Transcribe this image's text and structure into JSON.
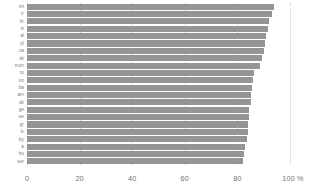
{
  "chart_data": {
    "type": "bar",
    "orientation": "horizontal",
    "title": "",
    "subtitle": "",
    "xlabel": "",
    "ylabel": "",
    "xlim": [
      0,
      100
    ],
    "xticks": [
      0,
      20,
      40,
      60,
      80,
      100
    ],
    "xticklabels": [
      "0",
      "20",
      "40",
      "60",
      "80",
      "100 %"
    ],
    "unit": "%",
    "grid": true,
    "grid_axis": "x",
    "grid_style": "dotted",
    "legend": false,
    "bar_color": "#959595",
    "categories": [
      "mt",
      "tr",
      "hr",
      "is",
      "al",
      "pl",
      "ca",
      "sk",
      "mon",
      "ro",
      "no",
      "ba",
      "am",
      "dk",
      "ge",
      "ee",
      "gr",
      "lv",
      "by",
      "a",
      "hu",
      "ser"
    ],
    "values": [
      94.0,
      93.0,
      92.0,
      91.5,
      91.0,
      90.5,
      90.0,
      89.5,
      88.5,
      86.5,
      86.0,
      85.5,
      85.0,
      85.0,
      84.5,
      84.5,
      84.0,
      84.0,
      83.5,
      83.0,
      82.5,
      82.0
    ],
    "series": [
      {
        "name": "",
        "values": [
          94.0,
          93.0,
          92.0,
          91.5,
          91.0,
          90.5,
          90.0,
          89.5,
          88.5,
          86.5,
          86.0,
          85.5,
          85.0,
          85.0,
          84.5,
          84.5,
          84.0,
          84.0,
          83.5,
          83.0,
          82.5,
          82.0
        ]
      }
    ]
  },
  "axis": {
    "x_tick_labels": [
      "0",
      "20",
      "40",
      "60",
      "80",
      "100 %"
    ]
  }
}
